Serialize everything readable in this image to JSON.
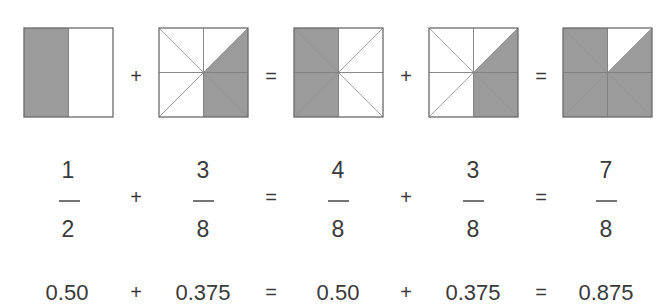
{
  "colors": {
    "shade": "#9b9b9b",
    "stroke": "#6a6a6a",
    "text": "#3a3a3a"
  },
  "squares": [
    {
      "name": "half-square",
      "division": "halves",
      "shaded": [
        "left-half"
      ]
    },
    {
      "name": "three-eighths-square-a",
      "division": "eighths",
      "shaded": [
        "right-top-triangle",
        "right-bottom-upper-triangle",
        "right-bottom-lower-triangle"
      ]
    },
    {
      "name": "four-eighths-square",
      "division": "eighths",
      "shaded": [
        "left-top-upper-triangle",
        "left-top-lower-triangle",
        "left-bottom-upper-triangle",
        "left-bottom-lower-triangle"
      ]
    },
    {
      "name": "three-eighths-square-b",
      "division": "eighths",
      "shaded": [
        "right-top-triangle",
        "right-bottom-upper-triangle",
        "right-bottom-lower-triangle"
      ]
    },
    {
      "name": "seven-eighths-square",
      "division": "eighths",
      "shaded": [
        "left-top-upper-triangle",
        "left-top-lower-triangle",
        "left-bottom-upper-triangle",
        "left-bottom-lower-triangle",
        "right-top-triangle",
        "right-bottom-upper-triangle",
        "right-bottom-lower-triangle"
      ]
    }
  ],
  "operators": [
    "+",
    "=",
    "+",
    "="
  ],
  "fractions": [
    {
      "numerator": "1",
      "denominator": "2"
    },
    {
      "numerator": "3",
      "denominator": "8"
    },
    {
      "numerator": "4",
      "denominator": "8"
    },
    {
      "numerator": "3",
      "denominator": "8"
    },
    {
      "numerator": "7",
      "denominator": "8"
    }
  ],
  "decimals": [
    "0.50",
    "0.375",
    "0.50",
    "0.375",
    "0.875"
  ]
}
